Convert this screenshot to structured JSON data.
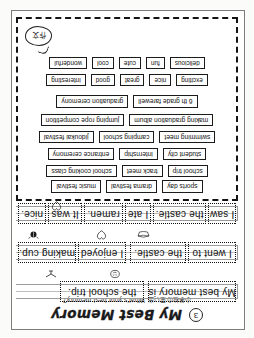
{
  "worksheet": {
    "number": "3",
    "title": "My Best Memory",
    "subtitle_jp": "小学校の思い出",
    "subtitle_en": "What's your best memory?",
    "icons": {
      "number_badge": "circled-number-icon",
      "heart": "heart-icon",
      "bowl": "ramen-bowl-icon",
      "bug": "beetle-icon",
      "face": "smiley-face-icon",
      "bird": "bird-icon",
      "balloon": "speech-balloon-icon"
    }
  },
  "answer_lines": [
    {
      "line_id": "line-1",
      "segments": [
        {
          "text": "My best memory is"
        },
        {
          "text": "the school trip."
        }
      ]
    },
    {
      "line_id": "line-2",
      "segments": [
        {
          "text": "I went to"
        },
        {
          "text": "the castle."
        },
        {
          "text": "I enjoyed"
        },
        {
          "text": "making cup."
        }
      ]
    },
    {
      "line_id": "line-3",
      "segments": [
        {
          "text": "I saw"
        },
        {
          "text": "the castle."
        },
        {
          "text": "I ate"
        },
        {
          "text": "ramen."
        },
        {
          "text": "It was"
        },
        {
          "text": "nice."
        }
      ]
    }
  ],
  "word_bank": {
    "balloon_text": "作文",
    "rows": [
      {
        "row_id": "events-row-1",
        "words": [
          "sports day",
          "drama festival",
          "music festival"
        ]
      },
      {
        "row_id": "events-row-2",
        "words": [
          "school trip",
          "track meet",
          "school cooking class"
        ]
      },
      {
        "row_id": "events-row-3",
        "words": [
          "student city",
          "internship",
          "entrance ceremony"
        ]
      },
      {
        "row_id": "events-row-4",
        "words": [
          "swimming meet",
          "camping school",
          "jidoukai festival"
        ]
      },
      {
        "row_id": "events-row-5",
        "words": [
          "making graduation album",
          "jumping rope competition"
        ]
      },
      {
        "row_id": "events-row-6",
        "words": [
          "6 th grade farewell",
          "graduation ceremony"
        ]
      },
      {
        "row_id": "adjectives-row-1",
        "words": [
          "exciting",
          "nice",
          "great",
          "good",
          "interesting"
        ]
      },
      {
        "row_id": "adjectives-row-2",
        "words": [
          "delicious",
          "fun",
          "cute",
          "cool",
          "wonderful"
        ]
      }
    ]
  }
}
